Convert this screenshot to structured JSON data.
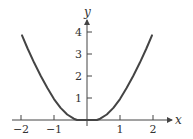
{
  "chart_data": {
    "type": "line",
    "title": "",
    "xlabel": "x",
    "ylabel": "y",
    "xlim": [
      -2.1,
      2.5
    ],
    "ylim": [
      0,
      4.6
    ],
    "grid": false,
    "x_ticks": [
      -2,
      -1,
      1,
      2
    ],
    "x_tick_labels": [
      "−2",
      "−1",
      "1",
      "2"
    ],
    "y_ticks": [
      1,
      2,
      3,
      4
    ],
    "y_tick_labels": [
      "1",
      "2",
      "3",
      "4"
    ],
    "series": [
      {
        "name": "f(x)",
        "color": "#444444",
        "x": [
          -1.97,
          -1.8,
          -1.6,
          -1.4,
          -1.2,
          -1.0,
          -0.8,
          -0.6,
          -0.4,
          -0.3,
          -0.2,
          0.0,
          0.2,
          0.3,
          0.4,
          0.6,
          0.8,
          1.0,
          1.2,
          1.4,
          1.6,
          1.8,
          1.97
        ],
        "y": [
          3.85,
          3.25,
          2.6,
          2.0,
          1.45,
          0.95,
          0.55,
          0.25,
          0.06,
          0.0,
          0.0,
          0.0,
          0.0,
          0.0,
          0.06,
          0.25,
          0.55,
          0.95,
          1.45,
          2.0,
          2.6,
          3.25,
          3.85
        ]
      }
    ]
  },
  "axes": {
    "x_label": "x",
    "y_label": "y"
  }
}
